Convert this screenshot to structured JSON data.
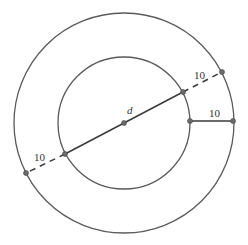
{
  "diagram": {
    "center": {
      "x": 124,
      "y": 123,
      "label": "d"
    },
    "outer_circle": {
      "r": 110
    },
    "inner_circle": {
      "r": 66
    },
    "diameter_line": {
      "inner_start": {
        "x": 65,
        "y": 154
      },
      "inner_end": {
        "x": 183,
        "y": 92
      },
      "outer_start": {
        "x": 26,
        "y": 173
      },
      "outer_end": {
        "x": 222,
        "y": 72
      }
    },
    "radial_segment": {
      "x1": 190,
      "y1": 121,
      "x2": 233,
      "y2": 121
    },
    "labels": {
      "dashed_upper": "10",
      "radial": "10",
      "dashed_lower": "10"
    },
    "colors": {
      "stroke": "#5a5a5a",
      "point": "#6b6b6b"
    }
  }
}
